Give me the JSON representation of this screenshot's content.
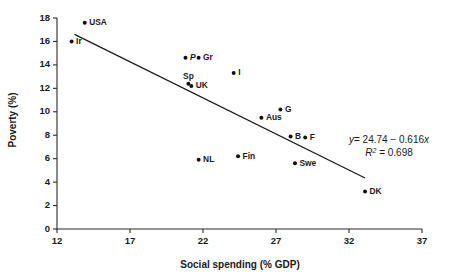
{
  "chart_data": {
    "type": "scatter",
    "title": "",
    "xlabel": "Social spending (% GDP)",
    "ylabel": "Poverty (%)",
    "xlim": [
      12,
      37
    ],
    "ylim": [
      0,
      18
    ],
    "xticks": [
      "12",
      "17",
      "22",
      "27",
      "32",
      "37"
    ],
    "yticks": [
      "0",
      "2",
      "4",
      "6",
      "8",
      "10",
      "12",
      "14",
      "16",
      "18"
    ],
    "grid": false,
    "legend": "none",
    "points": [
      {
        "label": "USA",
        "x": 13.9,
        "y": 17.6,
        "label_side": "right",
        "italic": false
      },
      {
        "label": "Ir",
        "x": 13.0,
        "y": 16.0,
        "label_side": "right",
        "italic": false
      },
      {
        "label": "P",
        "x": 20.8,
        "y": 14.6,
        "label_side": "right",
        "italic": true
      },
      {
        "label": "Gr",
        "x": 21.7,
        "y": 14.6,
        "label_side": "right",
        "italic": false
      },
      {
        "label": "I",
        "x": 24.1,
        "y": 13.3,
        "label_side": "right",
        "italic": false
      },
      {
        "label": "Sp",
        "x": 21.0,
        "y": 12.4,
        "label_side": "above",
        "italic": false
      },
      {
        "label": "UK",
        "x": 21.2,
        "y": 12.2,
        "label_side": "right",
        "italic": false
      },
      {
        "label": "G",
        "x": 27.3,
        "y": 10.2,
        "label_side": "right",
        "italic": false
      },
      {
        "label": "Aus",
        "x": 26.0,
        "y": 9.5,
        "label_side": "right",
        "italic": false
      },
      {
        "label": "B",
        "x": 28.0,
        "y": 7.9,
        "label_side": "right",
        "italic": false
      },
      {
        "label": "F",
        "x": 29.0,
        "y": 7.8,
        "label_side": "right",
        "italic": false
      },
      {
        "label": "Fin",
        "x": 24.4,
        "y": 6.2,
        "label_side": "right",
        "italic": false
      },
      {
        "label": "NL",
        "x": 21.7,
        "y": 5.9,
        "label_side": "right",
        "italic": false
      },
      {
        "label": "Swe",
        "x": 28.3,
        "y": 5.6,
        "label_side": "right",
        "italic": false
      },
      {
        "label": "DK",
        "x": 33.1,
        "y": 3.2,
        "label_side": "right",
        "italic": false
      }
    ],
    "fit": {
      "intercept": 24.74,
      "slope": -0.616,
      "r_squared": 0.698,
      "x_start": 13.2,
      "x_end": 33.1,
      "equation_text": "y = 24.74 - 0.616x",
      "equation_lhs": "y",
      "equation_rhs": "= 24.74 − 0.616",
      "equation_var": "x",
      "r2_symbol": "R",
      "r2_exponent": "2",
      "r2_value": "= 0.698"
    }
  }
}
